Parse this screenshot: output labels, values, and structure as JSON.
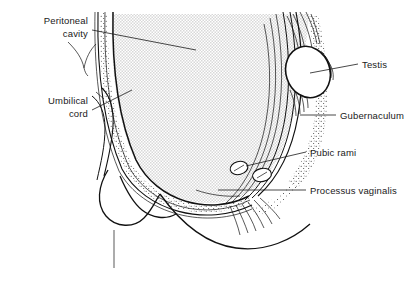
{
  "figure": {
    "width": 416,
    "height": 294,
    "background_color": "#ffffff",
    "ink_color": "#111111",
    "cavity_fill_color": "#e8e8e8",
    "stipple_color": "#333333"
  },
  "labels": [
    {
      "id": "peritoneal-cavity",
      "lines": [
        "Peritoneal",
        "cavity"
      ],
      "align": "right",
      "x": 88,
      "y": 24,
      "line_height": 13,
      "leader": "M 92,30 L 196,50"
    },
    {
      "id": "umbilical-cord",
      "lines": [
        "Umbilical",
        "cord"
      ],
      "align": "right",
      "x": 88,
      "y": 104,
      "line_height": 13,
      "leader": "M 92,110 L 132,90"
    },
    {
      "id": "testis",
      "lines": [
        "Testis"
      ],
      "align": "left",
      "x": 362,
      "y": 68,
      "line_height": 13,
      "leader": "M 358,64 L 310,73"
    },
    {
      "id": "gubernaculum",
      "lines": [
        "Gubernaculum"
      ],
      "align": "left",
      "x": 340,
      "y": 119,
      "line_height": 13,
      "leader": "M 336,115 L 300,115"
    },
    {
      "id": "pubic-rami",
      "lines": [
        "Pubic rami"
      ],
      "align": "left",
      "x": 310,
      "y": 156,
      "line_height": 13,
      "leader": "M 306,152 L 246,166"
    },
    {
      "id": "processus-vaginalis",
      "lines": [
        "Processus vaginalis"
      ],
      "align": "left",
      "x": 310,
      "y": 194,
      "line_height": 13,
      "leader": "M 306,190 L 218,190"
    }
  ],
  "structures": [
    {
      "id": "peritoneal-cavity-region",
      "name": "Peritoneal cavity"
    },
    {
      "id": "abdominal-wall",
      "name": "Anterior abdominal wall"
    },
    {
      "id": "umbilical-cord-stalk",
      "name": "Umbilical cord"
    },
    {
      "id": "testis-oval",
      "name": "Testis"
    },
    {
      "id": "gubernaculum-band",
      "name": "Gubernaculum"
    },
    {
      "id": "pubic-ramus-upper",
      "name": "Pubic ramus (upper)"
    },
    {
      "id": "pubic-ramus-lower",
      "name": "Pubic ramus (lower)"
    },
    {
      "id": "processus-vaginalis-band",
      "name": "Processus vaginalis"
    },
    {
      "id": "penis-bladder-outline",
      "name": "Penis / lower body outline"
    },
    {
      "id": "scrotal-sac-outline",
      "name": "Scrotal / perineal contour"
    }
  ]
}
